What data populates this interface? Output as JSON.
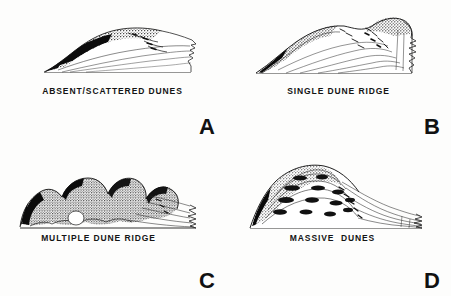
{
  "figure": {
    "background_color": "#fdfdfc",
    "ink_color": "#111111",
    "layout": "2x2 grid of block-diagram illustrations"
  },
  "panels": [
    {
      "letter": "A",
      "caption": "ABSENT/SCATTERED DUNES",
      "art_name": "dune-block-diagram-absent-scattered",
      "description": "Low flat beach-ridge profile with thin scattered dark vegetation stipple along the crest"
    },
    {
      "letter": "B",
      "caption": "SINGLE DUNE RIDGE",
      "art_name": "dune-block-diagram-single-ridge",
      "description": "One elongated dune ridge rising to a single crest with seaward slope hatching"
    },
    {
      "letter": "C",
      "caption": "MULTIPLE DUNE RIDGE",
      "art_name": "dune-block-diagram-multiple-ridge",
      "description": "Several rounded parallel dune ridges with heavy stipple texture across the field"
    },
    {
      "letter": "D",
      "caption": "MASSIVE  DUNES",
      "art_name": "dune-block-diagram-massive-dunes",
      "description": "Large high-relief dune mass with nested contour ridges and steep seaward face"
    }
  ]
}
